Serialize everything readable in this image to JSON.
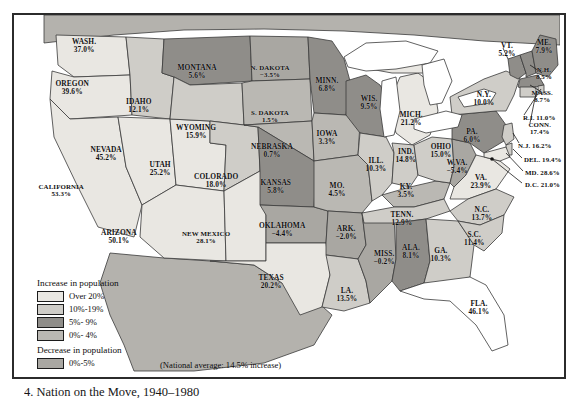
{
  "figure": {
    "caption": "4. Nation on the Move, 1940–1980",
    "national_average_note": "(National average: 14.5% increase)"
  },
  "legend": {
    "increase_title": "Increase in population",
    "decrease_title": "Decrease in population",
    "increase_items": [
      {
        "label": "Over 20%",
        "color": "#e9e7e2"
      },
      {
        "label": "10%-19%",
        "color": "#cfcdc8"
      },
      {
        "label": "5%- 9%",
        "color": "#8f8d89"
      },
      {
        "label": "0%- 4%",
        "color": "#bab8b3"
      }
    ],
    "decrease_items": [
      {
        "label": "0%-5%",
        "color": "#a9a7a2"
      }
    ]
  },
  "colors": {
    "over20": "#e9e7e2",
    "pct10_19": "#cfcdc8",
    "pct5_9": "#8f8d89",
    "pct0_4": "#bab8b3",
    "decrease": "#a9a7a2",
    "foreign": "#b4b2ad",
    "water": "#ffffff",
    "outline": "#3a3a3a",
    "frame": "#2b2b2b"
  },
  "map": {
    "title": "United States population change by state, 1940-1980",
    "states": [
      {
        "name": "WASH.",
        "pct": "37.0%",
        "value": 37.0,
        "band": "over20",
        "x": 70,
        "y": 31
      },
      {
        "name": "OREGON",
        "pct": "39.6%",
        "value": 39.6,
        "band": "over20",
        "x": 58,
        "y": 73
      },
      {
        "name": "CALIFORNIA",
        "pct": "53.3%",
        "value": 53.3,
        "band": "over20",
        "x": 47,
        "y": 175
      },
      {
        "name": "IDAHO",
        "pct": "12.1%",
        "value": 12.1,
        "band": "pct10_19",
        "x": 125,
        "y": 91
      },
      {
        "name": "NEVADA",
        "pct": "45.2%",
        "value": 45.2,
        "band": "over20",
        "x": 92,
        "y": 139
      },
      {
        "name": "UTAH",
        "pct": "25.2%",
        "value": 25.2,
        "band": "over20",
        "x": 146,
        "y": 154
      },
      {
        "name": "ARIZONA",
        "pct": "50.1%",
        "value": 50.1,
        "band": "over20",
        "x": 105,
        "y": 222
      },
      {
        "name": "MONTANA",
        "pct": "5.6%",
        "value": 5.6,
        "band": "pct5_9",
        "x": 183,
        "y": 57
      },
      {
        "name": "WYOMING",
        "pct": "15.9%",
        "value": 15.9,
        "band": "pct10_19",
        "x": 182,
        "y": 117
      },
      {
        "name": "COLORADO",
        "pct": "18.0%",
        "value": 18.0,
        "band": "pct10_19",
        "x": 202,
        "y": 166
      },
      {
        "name": "NEW MEXICO",
        "pct": "28.1%",
        "value": 28.1,
        "band": "over20",
        "x": 192,
        "y": 222
      },
      {
        "name": "N. DAKOTA",
        "pct": "−3.5%",
        "value": -3.5,
        "band": "decrease",
        "x": 256,
        "y": 56
      },
      {
        "name": "S. DAKOTA",
        "pct": "1.5%",
        "value": 1.5,
        "band": "pct0_4",
        "x": 256,
        "y": 101
      },
      {
        "name": "NEBRASKA",
        "pct": "0.7%",
        "value": 0.7,
        "band": "pct0_4",
        "x": 258,
        "y": 136
      },
      {
        "name": "KANSAS",
        "pct": "5.8%",
        "value": 5.8,
        "band": "pct5_9",
        "x": 262,
        "y": 172
      },
      {
        "name": "OKLAHOMA",
        "pct": "−4.4%",
        "value": -4.4,
        "band": "decrease",
        "x": 268,
        "y": 215
      },
      {
        "name": "TEXAS",
        "pct": "20.2%",
        "value": 20.2,
        "band": "over20",
        "x": 257,
        "y": 267
      },
      {
        "name": "MINN.",
        "pct": "6.8%",
        "value": 6.8,
        "band": "pct5_9",
        "x": 313,
        "y": 70
      },
      {
        "name": "IOWA",
        "pct": "3.3%",
        "value": 3.3,
        "band": "pct0_4",
        "x": 313,
        "y": 123
      },
      {
        "name": "MO.",
        "pct": "4.5%",
        "value": 4.5,
        "band": "pct0_4",
        "x": 323,
        "y": 175
      },
      {
        "name": "ARK.",
        "pct": "−2.0%",
        "value": -2.0,
        "band": "decrease",
        "x": 332,
        "y": 218
      },
      {
        "name": "LA.",
        "pct": "13.5%",
        "value": 13.5,
        "band": "pct10_19",
        "x": 333,
        "y": 280
      },
      {
        "name": "WIS.",
        "pct": "9.5%",
        "value": 9.5,
        "band": "pct5_9",
        "x": 355,
        "y": 88
      },
      {
        "name": "ILL.",
        "pct": "10.3%",
        "value": 10.3,
        "band": "pct10_19",
        "x": 362,
        "y": 150
      },
      {
        "name": "MISS.",
        "pct": "−0.2%",
        "value": -0.2,
        "band": "decrease",
        "x": 370,
        "y": 243
      },
      {
        "name": "MICH.",
        "pct": "21.2%",
        "value": 21.2,
        "band": "over20",
        "x": 397,
        "y": 104
      },
      {
        "name": "IND.",
        "pct": "14.8%",
        "value": 14.8,
        "band": "pct10_19",
        "x": 392,
        "y": 141
      },
      {
        "name": "KY.",
        "pct": "3.5%",
        "value": 3.5,
        "band": "pct0_4",
        "x": 392,
        "y": 176
      },
      {
        "name": "TENN.",
        "pct": "12.9%",
        "value": 12.9,
        "band": "pct10_19",
        "x": 388,
        "y": 204
      },
      {
        "name": "ALA.",
        "pct": "8.1%",
        "value": 8.1,
        "band": "pct5_9",
        "x": 397,
        "y": 237
      },
      {
        "name": "OHIO",
        "pct": "15.0%",
        "value": 15.0,
        "band": "pct10_19",
        "x": 427,
        "y": 136
      },
      {
        "name": "GA.",
        "pct": "10.3%",
        "value": 10.3,
        "band": "pct10_19",
        "x": 427,
        "y": 240
      },
      {
        "name": "FLA.",
        "pct": "46.1%",
        "value": 46.1,
        "band": "over20",
        "x": 465,
        "y": 293
      },
      {
        "name": "W.VA.",
        "pct": "−5.4%",
        "value": -5.4,
        "band": "decrease",
        "x": 443,
        "y": 152
      },
      {
        "name": "VA.",
        "pct": "23.9%",
        "value": 23.9,
        "band": "over20",
        "x": 467,
        "y": 167
      },
      {
        "name": "N.C.",
        "pct": "13.7%",
        "value": 13.7,
        "band": "pct10_19",
        "x": 468,
        "y": 199
      },
      {
        "name": "S.C.",
        "pct": "11.4%",
        "value": 11.4,
        "band": "pct10_19",
        "x": 460,
        "y": 224
      },
      {
        "name": "PA.",
        "pct": "6.0%",
        "value": 6.0,
        "band": "pct5_9",
        "x": 458,
        "y": 121
      },
      {
        "name": "N.Y.",
        "pct": "10.0%",
        "value": 10.0,
        "band": "pct10_19",
        "x": 470,
        "y": 84
      },
      {
        "name": "VT.",
        "pct": "5.2%",
        "value": 5.2,
        "band": "pct5_9",
        "x": 493,
        "y": 35
      },
      {
        "name": "ME.",
        "pct": "7.9%",
        "value": 7.9,
        "band": "pct5_9",
        "x": 530,
        "y": 32
      }
    ],
    "callouts": [
      {
        "name": "N.H.",
        "pct": "8.5%",
        "value": 8.5,
        "band": "pct5_9",
        "x": 530,
        "y": 58,
        "two_line": true
      },
      {
        "name": "MASS.",
        "pct": "8.7%",
        "value": 8.7,
        "band": "pct5_9",
        "x": 528,
        "y": 81,
        "two_line": true
      },
      {
        "name": "R.I.",
        "pct": "11.0%",
        "value": 11.0,
        "band": "pct10_19",
        "x": 509,
        "y": 103,
        "two_line": false
      },
      {
        "name": "CONN.",
        "pct": "17.4%",
        "value": 17.4,
        "band": "pct10_19",
        "x": 526,
        "y": 113,
        "two_line": true
      },
      {
        "name": "N.J.",
        "pct": "16.2%",
        "value": 16.2,
        "band": "pct10_19",
        "x": 504,
        "y": 131,
        "two_line": false
      },
      {
        "name": "DEL.",
        "pct": "19.4%",
        "value": 19.4,
        "band": "pct10_19",
        "x": 510,
        "y": 145,
        "two_line": false
      },
      {
        "name": "MD.",
        "pct": "28.6%",
        "value": 28.6,
        "band": "over20",
        "x": 511,
        "y": 158,
        "two_line": false
      },
      {
        "name": "D.C.",
        "pct": "21.0%",
        "value": 21.0,
        "band": "over20",
        "x": 511,
        "y": 170,
        "two_line": false
      }
    ]
  }
}
